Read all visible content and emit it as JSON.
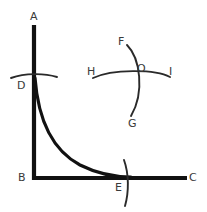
{
  "figure": {
    "kind": "geometry-diagram",
    "background_color": "#ffffff",
    "stroke_color": "#111111",
    "arc_color": "#2a2a2a",
    "label_color": "#3a3a3a",
    "width": 207,
    "height": 212
  },
  "labels": {
    "a": "A",
    "b": "B",
    "c": "C",
    "d": "D",
    "e": "E",
    "f": "F",
    "g": "G",
    "h": "H",
    "i": "I",
    "o": "O"
  },
  "label_positions": {
    "a": {
      "x": 30,
      "y": 11
    },
    "b": {
      "x": 18,
      "y": 172
    },
    "c": {
      "x": 189,
      "y": 172
    },
    "d": {
      "x": 17,
      "y": 80
    },
    "e": {
      "x": 115,
      "y": 182
    },
    "f": {
      "x": 118,
      "y": 36
    },
    "g": {
      "x": 128,
      "y": 118
    },
    "h": {
      "x": 87,
      "y": 66
    },
    "i": {
      "x": 169,
      "y": 66
    },
    "o": {
      "x": 137,
      "y": 63
    }
  },
  "geometry": {
    "vertical_axis": {
      "name": "axis-ab",
      "x": 34,
      "y_top": 25,
      "y_bottom": 180
    },
    "horizontal_axis": {
      "name": "axis-bc",
      "y": 178,
      "x_left": 32,
      "x_right": 187
    },
    "decay_curve": {
      "name": "curve-de",
      "start": {
        "x": 35,
        "y": 78
      },
      "end": {
        "x": 131,
        "y": 177
      },
      "shape": "hyperbolic-decay"
    },
    "tick_arc_d": {
      "name": "arc-d",
      "x_left": 11,
      "x_right": 57,
      "y": 75,
      "orientation": "horizontal"
    },
    "tick_arc_e": {
      "name": "arc-e",
      "x": 127,
      "y_top": 160,
      "y_bottom": 206,
      "orientation": "vertical"
    },
    "cross_arc_fg": {
      "name": "arc-fg",
      "from": "F",
      "to": "G",
      "orientation": "vertical",
      "bow": "right"
    },
    "cross_arc_hi": {
      "name": "arc-hi",
      "from": "H",
      "to": "I",
      "orientation": "horizontal",
      "bow": "up"
    },
    "cross_center": {
      "name": "point-o",
      "x": 141,
      "y": 73
    }
  }
}
